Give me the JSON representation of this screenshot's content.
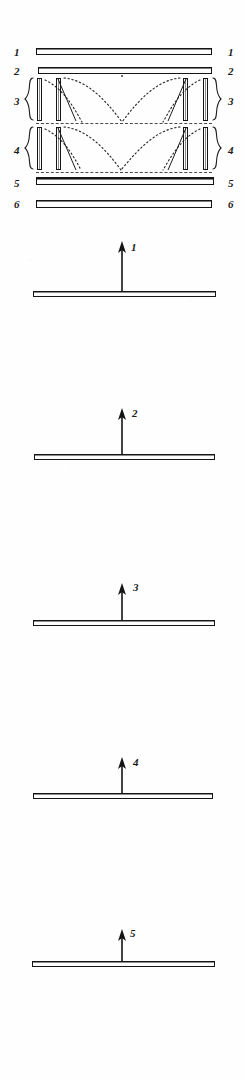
{
  "figure": {
    "background_color": "#ffffff",
    "ink_color": "#141414",
    "width": 244,
    "height": 1081
  },
  "assembly": {
    "left_labels": [
      "1",
      "2",
      "3",
      "4",
      "5",
      "6"
    ],
    "right_labels": [
      "1",
      "2",
      "3",
      "4",
      "5",
      "6"
    ],
    "brace_groups": [
      "3",
      "4"
    ],
    "layers": [
      {
        "id": "1",
        "type": "plate",
        "label": "1"
      },
      {
        "id": "2",
        "type": "plate",
        "label": "2"
      },
      {
        "id": "3",
        "type": "pillar-band",
        "label": "3",
        "post_count": 4
      },
      {
        "id": "4",
        "type": "pillar-band",
        "label": "4",
        "post_count": 4
      },
      {
        "id": "5",
        "type": "plate",
        "label": "5"
      },
      {
        "id": "6",
        "type": "plate",
        "label": "6"
      }
    ]
  },
  "panels": [
    {
      "label": "1",
      "arrow": "up-arrow-icon",
      "arrow_length": 44
    },
    {
      "label": "2",
      "arrow": "up-arrow-icon",
      "arrow_length": 38
    },
    {
      "label": "3",
      "arrow": "up-arrow-icon",
      "arrow_length": 34
    },
    {
      "label": "4",
      "arrow": "up-arrow-icon",
      "arrow_length": 30
    },
    {
      "label": "5",
      "arrow": "up-arrow-icon",
      "arrow_length": 24
    }
  ]
}
